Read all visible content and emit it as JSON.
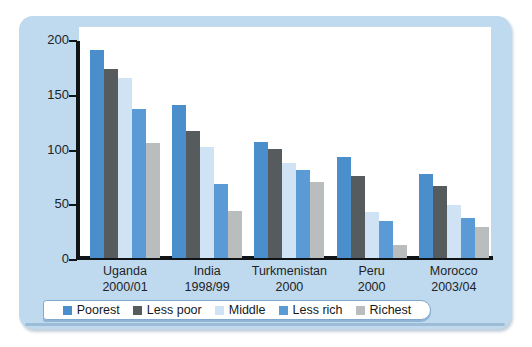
{
  "chart_data": {
    "type": "bar",
    "title": "",
    "subtitle": "",
    "xlabel": "",
    "ylabel": "",
    "ylim": [
      0,
      200
    ],
    "yticks": [
      0,
      50,
      100,
      150,
      200
    ],
    "ytick_labels": [
      "0",
      "50",
      "100",
      "150",
      "200"
    ],
    "grid": false,
    "legend_position": "bottom",
    "categories": [
      "Uganda\n2000/01",
      "India\n1998/99",
      "Turkmenistan\n2000",
      "Peru\n2000",
      "Morocco\n2003/04"
    ],
    "category_lines": [
      {
        "country": "Uganda",
        "year": "2000/01"
      },
      {
        "country": "India",
        "year": "1998/99"
      },
      {
        "country": "Turkmenistan",
        "year": "2000"
      },
      {
        "country": "Peru",
        "year": "2000"
      },
      {
        "country": "Morocco",
        "year": "2003/04"
      }
    ],
    "series": [
      {
        "name": "Poorest",
        "color": "#4a8fcc",
        "values": [
          190,
          140,
          106,
          92,
          77
        ]
      },
      {
        "name": "Less poor",
        "color": "#565c5e",
        "values": [
          173,
          116,
          100,
          75,
          66
        ]
      },
      {
        "name": "Middle",
        "color": "#cfe3f4",
        "values": [
          164,
          101,
          87,
          42,
          48
        ]
      },
      {
        "name": "Less rich",
        "color": "#5b9bd5",
        "values": [
          136,
          68,
          80,
          34,
          37
        ]
      },
      {
        "name": "Richest",
        "color": "#b9bdbe",
        "values": [
          105,
          43,
          69,
          12,
          28
        ]
      }
    ]
  },
  "legend": {
    "items": [
      {
        "label": "Poorest",
        "color": "#4a8fcc"
      },
      {
        "label": "Less poor",
        "color": "#565c5e"
      },
      {
        "label": "Middle",
        "color": "#cfe3f4"
      },
      {
        "label": "Less rich",
        "color": "#5b9bd5"
      },
      {
        "label": "Richest",
        "color": "#b9bdbe"
      }
    ]
  },
  "theme": {
    "panel_background": "#bfd9ef",
    "plot_background": "#ffffff",
    "axis_color": "#111416",
    "text_color": "#1d2427",
    "legend_background": "#ffffff",
    "legend_border": "#7fa8cc"
  }
}
